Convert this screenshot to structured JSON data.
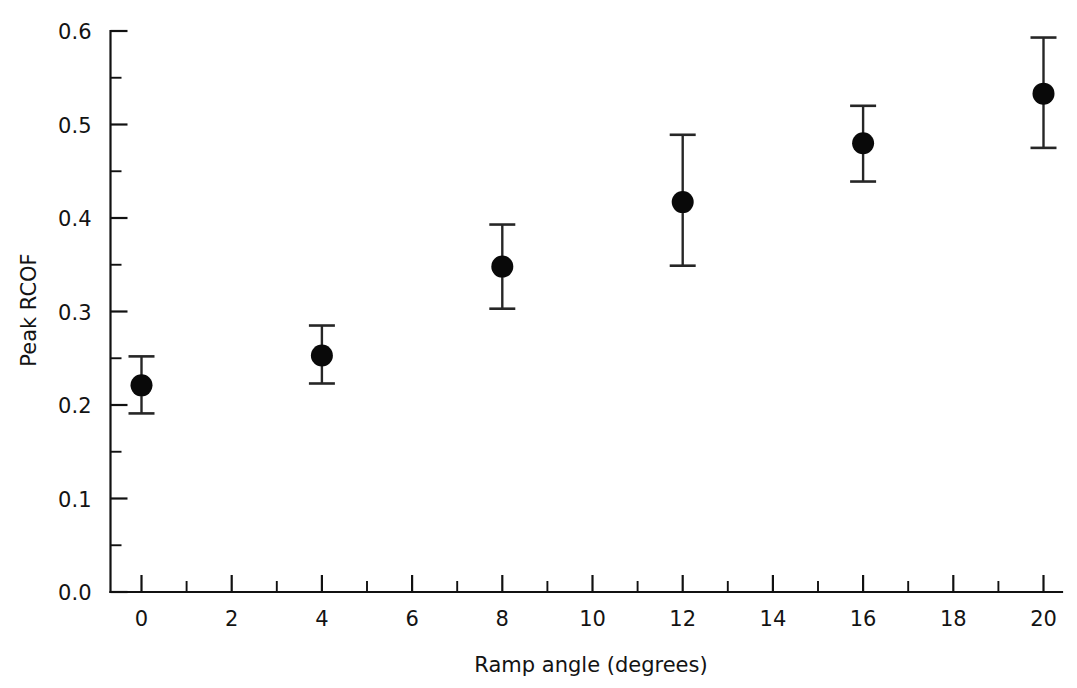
{
  "chart_data": {
    "type": "scatter",
    "title": "",
    "xlabel": "Ramp angle (degrees)",
    "ylabel": "Peak RCOF",
    "xlim": [
      -0.5,
      20.8
    ],
    "ylim": [
      0.0,
      0.6
    ],
    "grid": false,
    "legend": null,
    "x": [
      0,
      4,
      8,
      12,
      16,
      20
    ],
    "values": [
      0.221,
      0.253,
      0.348,
      0.417,
      0.48,
      0.533
    ],
    "error_low": [
      0.191,
      0.223,
      0.303,
      0.349,
      0.439,
      0.475
    ],
    "error_high": [
      0.252,
      0.285,
      0.393,
      0.489,
      0.52,
      0.593
    ],
    "series": [
      {
        "name": "Peak RCOF",
        "points": [
          {
            "x": 0,
            "y": 0.221,
            "low": 0.191,
            "high": 0.252
          },
          {
            "x": 4,
            "y": 0.253,
            "low": 0.223,
            "high": 0.285
          },
          {
            "x": 8,
            "y": 0.348,
            "low": 0.303,
            "high": 0.393
          },
          {
            "x": 12,
            "y": 0.417,
            "low": 0.349,
            "high": 0.489
          },
          {
            "x": 16,
            "y": 0.48,
            "low": 0.439,
            "high": 0.52
          },
          {
            "x": 20,
            "y": 0.533,
            "low": 0.475,
            "high": 0.593
          }
        ]
      }
    ],
    "x_ticks_major": [
      0,
      2,
      4,
      6,
      8,
      10,
      12,
      14,
      16,
      18,
      20
    ],
    "x_tick_labels": [
      "0",
      "2",
      "4",
      "6",
      "8",
      "10",
      "12",
      "14",
      "16",
      "18",
      "20"
    ],
    "x_ticks_minor": [
      1,
      3,
      5,
      7,
      9,
      11,
      13,
      15,
      17,
      19
    ],
    "y_ticks_major": [
      0.0,
      0.1,
      0.2,
      0.3,
      0.4,
      0.5,
      0.6
    ],
    "y_tick_labels": [
      "0.0",
      "0.1",
      "0.2",
      "0.3",
      "0.4",
      "0.5",
      "0.6"
    ],
    "y_ticks_minor": [
      0.05,
      0.15,
      0.25,
      0.35,
      0.45,
      0.55
    ],
    "marker": {
      "shape": "circle",
      "color": "#090909",
      "radius": 11
    },
    "errorbar_color": "#262626",
    "background_color": "#ffffff",
    "axis_color": "#111111"
  }
}
